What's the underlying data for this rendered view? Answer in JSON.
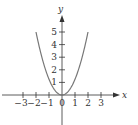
{
  "chart_data": {
    "type": "line",
    "title": "",
    "xlabel": "x",
    "ylabel": "y",
    "function": "y = x^2",
    "x_ticks": [
      -3,
      -2,
      -1,
      0,
      1,
      2,
      3
    ],
    "x_tick_labels": [
      "−3",
      "−2",
      "−1",
      "0",
      "1",
      "2",
      "3"
    ],
    "y_ticks": [
      1,
      2,
      3,
      4,
      5
    ],
    "y_tick_labels": [
      "1",
      "2",
      "3",
      "4",
      "5"
    ],
    "xlim": [
      -4,
      4.5
    ],
    "ylim": [
      0,
      6
    ],
    "grid": false,
    "series": [
      {
        "name": "parabola",
        "x": [
          -2,
          -1.5,
          -1,
          -0.5,
          0,
          0.5,
          1,
          1.5,
          2
        ],
        "values": [
          5,
          2.8,
          1.25,
          0.31,
          0,
          0.31,
          1.25,
          2.8,
          5
        ]
      }
    ],
    "colors": {
      "curve": "#777777",
      "axes": "#333333"
    }
  }
}
